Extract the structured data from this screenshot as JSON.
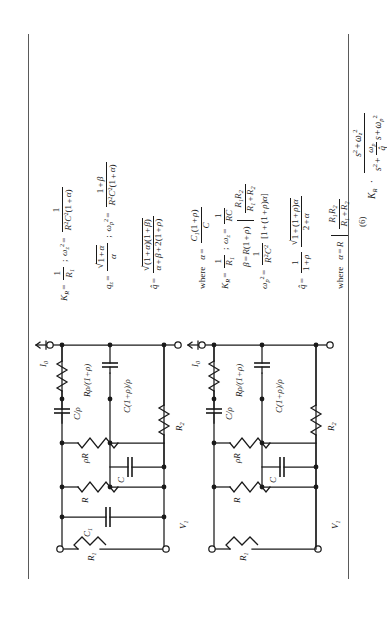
{
  "page": {
    "orientation_deg": -90,
    "background": "#ffffff",
    "ink": "#1a1a1a",
    "rule_color": "#5a5a5a"
  },
  "equation_number": "(6)",
  "transfer_function": {
    "prefix": "K",
    "prefix_sub": "R",
    "dot": "·",
    "numerator": {
      "term1": "s",
      "term1_sup": "2",
      "plus": "+",
      "term2": "ω",
      "term2_sub": "z",
      "term2_sup": "2"
    },
    "denominator": {
      "term1": "s",
      "term1_sup": "2",
      "plus1": "+",
      "frac_num": "ω",
      "frac_num_sub": "p",
      "frac_den": "q̂",
      "mid": "s",
      "plus2": "+",
      "term3": "ω",
      "term3_sub": "p",
      "term3_sup": "2"
    }
  },
  "rows": [
    {
      "id": "row-1",
      "circuit": {
        "name": "circuit-a",
        "input_label": "V",
        "input_label_sub": "1",
        "current_label": "I",
        "current_label_sub": "0",
        "components": [
          {
            "name": "R1",
            "text": "R",
            "sub": "1"
          },
          {
            "name": "C1",
            "text": "C",
            "sub": "1"
          },
          {
            "name": "R",
            "text": "R",
            "sub": ""
          },
          {
            "name": "rhoR",
            "text": "ρR",
            "sub": ""
          },
          {
            "name": "C",
            "text": "C",
            "sub": ""
          },
          {
            "name": "C-over-rho",
            "num": "C",
            "den": "ρ"
          },
          {
            "name": "R-rho-over-1plusrho",
            "lead": "R",
            "num": "ρ",
            "den": "1 + ρ"
          },
          {
            "name": "C-1plusrho-over-rho",
            "lead": "C",
            "num": "1 + ρ",
            "den": "ρ"
          },
          {
            "name": "R2",
            "text": "R",
            "sub": "2"
          }
        ]
      },
      "equations": [
        {
          "id": "eq-a1",
          "parts": [
            "K",
            "R",
            "=",
            "1/R1",
            ";",
            "ωz²",
            "=",
            "1/(R²C²(1+α))"
          ],
          "latex": "K_R = \\frac{1}{R_1};\\ \\omega_z^2 = \\frac{1}{R^2C^2(1+\\alpha)}"
        },
        {
          "id": "eq-a2",
          "latex": "q_z = \\frac{\\sqrt{1+\\alpha}}{\\alpha};\\ \\omega_p^2 = \\frac{1+\\beta}{R^2C^2(1+\\alpha)}"
        },
        {
          "id": "eq-a3",
          "latex": "\\hat{q} = \\frac{\\sqrt{(1+\\alpha)(1+\\beta)}}{\\alpha+\\beta+2(1+\\rho)}"
        },
        {
          "id": "eq-a4",
          "latex": "\\text{where}\\ \\ \\alpha = \\frac{C_1(1+\\rho)}{C}"
        },
        {
          "id": "eq-a5",
          "latex": "\\beta = R(1+\\rho)\\Big/ \\frac{R_1R_2}{R_1+R_2}"
        }
      ]
    },
    {
      "id": "row-2",
      "circuit": {
        "name": "circuit-b",
        "input_label": "V",
        "input_label_sub": "1",
        "current_label": "I",
        "current_label_sub": "0",
        "components": [
          {
            "name": "R1",
            "text": "R",
            "sub": "1"
          },
          {
            "name": "R",
            "text": "R",
            "sub": ""
          },
          {
            "name": "rhoR",
            "text": "ρR",
            "sub": ""
          },
          {
            "name": "C",
            "text": "C",
            "sub": ""
          },
          {
            "name": "C-over-rho",
            "num": "C",
            "den": "ρ"
          },
          {
            "name": "R-rho-over-1plusrho",
            "lead": "R",
            "num": "ρ",
            "den": "1 + ρ"
          },
          {
            "name": "C-1plusrho-over-rho",
            "lead": "C",
            "num": "1 + ρ",
            "den": "ρ"
          },
          {
            "name": "R2",
            "text": "R",
            "sub": "2"
          }
        ]
      },
      "equations": [
        {
          "id": "eq-b1",
          "latex": "K_R = \\frac{1}{R_1};\\ \\omega_z = \\frac{1}{RC}"
        },
        {
          "id": "eq-b2",
          "latex": "\\omega_p^2 = \\frac{1}{R^2C^2}[1+(1+\\rho)\\alpha]"
        },
        {
          "id": "eq-b3",
          "latex": "\\hat{q} = \\frac{1}{1+\\rho}\\frac{\\sqrt{1+(1+\\rho)\\alpha}}{2+\\alpha}"
        },
        {
          "id": "eq-b4",
          "latex": "\\text{where}\\ \\ \\alpha = R\\Big/\\frac{R_1R_2}{R_1+R_2}"
        }
      ]
    }
  ],
  "symbols": {
    "alpha": "α",
    "beta": "β",
    "rho": "ρ",
    "omega": "ω",
    "sqrt": "√",
    "dot": "·",
    "qhat": "q̂"
  }
}
